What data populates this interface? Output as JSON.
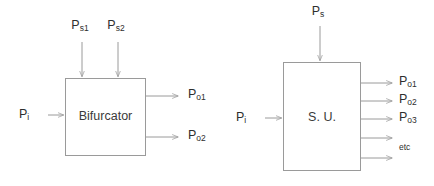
{
  "diagram": {
    "colors": {
      "background": "#ffffff",
      "line": "#9a9a9a",
      "box_stroke": "#9a9a9a",
      "box_fill": "#ffffff",
      "label_text": "#2e2e2e",
      "block_text": "#3a3a3a"
    },
    "blocks": [
      {
        "id": "bifurcator",
        "label": "Bifurcator",
        "x": 65,
        "y": 78,
        "w": 80,
        "h": 77
      },
      {
        "id": "su",
        "label": "S. U.",
        "x": 283,
        "y": 62,
        "w": 77,
        "h": 108
      }
    ],
    "left_block": {
      "name": "Bifurcator",
      "top_inputs": [
        {
          "base": "P",
          "sub": "s1",
          "x": 82
        },
        {
          "base": "P",
          "sub": "s2",
          "x": 118
        }
      ],
      "side_input": {
        "base": "P",
        "sub": "i",
        "y": 115
      },
      "outputs": [
        {
          "base": "P",
          "sub": "o1",
          "y": 96
        },
        {
          "base": "P",
          "sub": "o2",
          "y": 137
        }
      ]
    },
    "right_block": {
      "name": "S. U.",
      "top_inputs": [
        {
          "base": "P",
          "sub": "s",
          "x": 320
        }
      ],
      "side_input": {
        "base": "P",
        "sub": "i",
        "y": 118
      },
      "outputs": [
        {
          "base": "P",
          "sub": "o1",
          "y": 83,
          "labeled": true
        },
        {
          "base": "P",
          "sub": "o2",
          "y": 101,
          "labeled": true
        },
        {
          "base": "P",
          "sub": "o3",
          "y": 119,
          "labeled": true
        },
        {
          "base": "",
          "sub": "",
          "y": 138,
          "labeled": false
        },
        {
          "base": "",
          "sub": "",
          "y": 158,
          "labeled": false
        }
      ],
      "etc_label": "etc"
    }
  }
}
